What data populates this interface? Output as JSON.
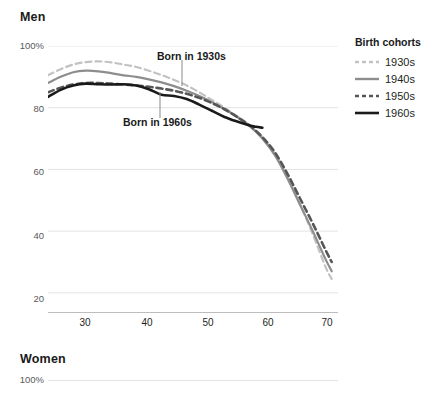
{
  "panels": {
    "men": {
      "title": "Men"
    },
    "women": {
      "title": "Women"
    }
  },
  "legend": {
    "title": "Birth cohorts",
    "position": "right",
    "items": [
      {
        "label": "1930s",
        "color": "#c2c2c2",
        "style": "dashed"
      },
      {
        "label": "1940s",
        "color": "#8d8d8d",
        "style": "solid"
      },
      {
        "label": "1950s",
        "color": "#565656",
        "style": "dashed"
      },
      {
        "label": "1960s",
        "color": "#1a1a1a",
        "style": "solid"
      }
    ]
  },
  "annotations": [
    {
      "name": "born-in-1930s",
      "text": "Born in 1930s"
    },
    {
      "name": "born-in-1960s",
      "text": "Born in 1960s"
    }
  ],
  "axes": {
    "y_ticks": [
      "100%",
      "80",
      "60",
      "40",
      "20"
    ],
    "x_ticks": [
      "30",
      "40",
      "50",
      "60",
      "70"
    ]
  },
  "women_axes": {
    "y_ticks": [
      "100%"
    ]
  },
  "chart_data": {
    "type": "line",
    "title": "Men",
    "subtitle": "",
    "xlabel": "",
    "ylabel": "",
    "xlim": [
      25,
      71
    ],
    "ylim": [
      18,
      100
    ],
    "grid": true,
    "grid_axis": "y",
    "legend_title": "Birth cohorts",
    "legend_position": "right",
    "y_tick_values": [
      100,
      80,
      60,
      40,
      20
    ],
    "y_tick_labels": [
      "100%",
      "80",
      "60",
      "40",
      "20"
    ],
    "x_tick_values": [
      30,
      40,
      50,
      60,
      70
    ],
    "x_tick_labels": [
      "30",
      "40",
      "50",
      "60",
      "70"
    ],
    "series": [
      {
        "name": "1930s",
        "color": "#c2c2c2",
        "style": "dashed",
        "x": [
          25,
          27,
          29,
          31,
          33,
          35,
          37,
          39,
          41,
          43,
          45,
          47,
          49,
          51,
          53,
          55,
          57,
          59,
          61,
          63,
          65,
          67,
          69,
          70
        ],
        "values": [
          90.5,
          92.5,
          94.0,
          94.8,
          95.0,
          94.7,
          94.0,
          93.2,
          92.0,
          90.6,
          89.0,
          87.2,
          85.0,
          82.5,
          80.0,
          77.2,
          74.2,
          70.5,
          65.0,
          57.5,
          48.5,
          39.0,
          28.5,
          24.5
        ]
      },
      {
        "name": "1940s",
        "color": "#8d8d8d",
        "style": "solid",
        "x": [
          25,
          27,
          29,
          31,
          33,
          35,
          37,
          39,
          41,
          43,
          45,
          47,
          49,
          51,
          53,
          55,
          57,
          59,
          61,
          63,
          65,
          67,
          69,
          70
        ],
        "values": [
          88.0,
          90.0,
          91.5,
          92.0,
          91.8,
          91.2,
          90.5,
          90.0,
          89.2,
          88.2,
          87.0,
          85.5,
          83.8,
          81.8,
          79.5,
          77.0,
          74.0,
          70.0,
          64.5,
          57.0,
          48.5,
          40.0,
          31.0,
          27.0
        ]
      },
      {
        "name": "1950s",
        "color": "#565656",
        "style": "dashed",
        "x": [
          25,
          27,
          29,
          31,
          33,
          35,
          37,
          39,
          41,
          43,
          45,
          47,
          49,
          51,
          53,
          55,
          57,
          59,
          61,
          63,
          65,
          67,
          69,
          70
        ],
        "values": [
          85.0,
          86.5,
          87.5,
          88.0,
          88.0,
          87.8,
          87.5,
          87.2,
          86.8,
          86.2,
          85.5,
          84.5,
          83.2,
          81.5,
          79.5,
          77.0,
          74.2,
          70.5,
          65.5,
          58.5,
          50.5,
          42.5,
          34.0,
          30.0
        ]
      },
      {
        "name": "1960s",
        "color": "#1a1a1a",
        "style": "solid",
        "x": [
          25,
          27,
          29,
          31,
          33,
          35,
          37,
          39,
          41,
          43,
          45,
          47,
          49,
          51,
          53,
          55,
          57,
          58,
          59
        ],
        "values": [
          83.5,
          85.8,
          87.2,
          87.8,
          87.6,
          87.5,
          87.6,
          87.2,
          86.0,
          84.2,
          83.8,
          82.8,
          81.0,
          79.0,
          77.0,
          75.5,
          74.2,
          73.8,
          73.5
        ]
      }
    ]
  }
}
